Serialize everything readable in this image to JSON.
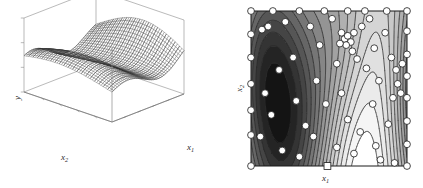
{
  "figure": {
    "title": "",
    "background_color": "#ffffff",
    "panels": [
      {
        "id": "surface",
        "kind": "3d-surface-mesh",
        "axis_labels": {
          "y": "y",
          "x1": "x",
          "x1_sub": "1",
          "x2": "x",
          "x2_sub": "2"
        }
      },
      {
        "id": "contour",
        "kind": "filled-contour",
        "axis_labels": {
          "x1": "x",
          "x1_sub": "1",
          "x2": "x",
          "x2_sub": "2"
        }
      }
    ]
  },
  "chart_data": [
    {
      "type": "surface",
      "id": "left-3d-surface",
      "title": "",
      "xlabel": "x1",
      "ylabel": "x2",
      "zlabel": "y",
      "xlim": [
        0,
        1
      ],
      "ylim": [
        0,
        1
      ],
      "zlim": [
        0,
        1
      ],
      "grid": false,
      "tick_labels_shown": false,
      "mesh": {
        "rows": 42,
        "cols": 42,
        "line_color": "#3a3a3a",
        "face_color": "#ffffff"
      },
      "surface_model": {
        "description": "two parallel ridges running diagonally, with a saddle valley between them and a flat low plain at the front-left corner",
        "formula_hint": "z = 0.46 + 0.30*sin(5.6*u + 0.9) * exp(-2.2*(v-0.52)^2) + 0.22*sin(3.1*v) * (0.3 + u)",
        "ridge_count": 2,
        "ridge_peak_z": [
          0.84,
          0.92
        ],
        "valley_z": 0.22
      },
      "box_color": "#8b8b8b",
      "tick_count_per_axis": 5
    },
    {
      "type": "contour",
      "id": "right-contour",
      "title": "",
      "xlabel": "x1",
      "ylabel": "x2",
      "xlim": [
        0,
        1
      ],
      "ylim": [
        0,
        1
      ],
      "grid": false,
      "tick_labels_shown": false,
      "filled": true,
      "n_levels": 18,
      "colormap": "gray",
      "colormap_stops": [
        "#000000",
        "#141414",
        "#242424",
        "#343434",
        "#454545",
        "#565656",
        "#666666",
        "#767676",
        "#868686",
        "#949494",
        "#a2a2a2",
        "#b0b0b0",
        "#bdbdbd",
        "#c9c9c9",
        "#d5d5d5",
        "#e0e0e0",
        "#ebebeb",
        "#f5f5f5",
        "#ffffff"
      ],
      "contour_line_color": "#2a2a2a",
      "border_color": "#1a1a1a",
      "sample_points": {
        "marker": "circle",
        "face_color": "#ffffff",
        "edge_color": "#1a1a1a",
        "radius_px": 3.4,
        "count": 72,
        "cluster_note": "a dense cluster of points sits near the upper-middle region around (0.60, 0.82)",
        "xy": [
          [
            0.0,
            1.0
          ],
          [
            0.14,
            1.0
          ],
          [
            0.31,
            1.0
          ],
          [
            0.47,
            1.0
          ],
          [
            0.62,
            1.0
          ],
          [
            0.73,
            1.0
          ],
          [
            0.87,
            1.0
          ],
          [
            1.0,
            1.0
          ],
          [
            0.0,
            0.85
          ],
          [
            0.0,
            0.7
          ],
          [
            0.0,
            0.53
          ],
          [
            0.0,
            0.36
          ],
          [
            0.0,
            0.2
          ],
          [
            0.0,
            0.0
          ],
          [
            1.0,
            0.87
          ],
          [
            1.0,
            0.72
          ],
          [
            1.0,
            0.58
          ],
          [
            1.0,
            0.44
          ],
          [
            1.0,
            0.29
          ],
          [
            1.0,
            0.14
          ],
          [
            1.0,
            0.0
          ],
          [
            0.07,
            0.88
          ],
          [
            0.11,
            0.9
          ],
          [
            0.22,
            0.93
          ],
          [
            0.27,
            0.7
          ],
          [
            0.18,
            0.62
          ],
          [
            0.09,
            0.47
          ],
          [
            0.13,
            0.33
          ],
          [
            0.06,
            0.19
          ],
          [
            0.2,
            0.1
          ],
          [
            0.31,
            0.06
          ],
          [
            0.35,
            0.26
          ],
          [
            0.29,
            0.42
          ],
          [
            0.42,
            0.55
          ],
          [
            0.44,
            0.78
          ],
          [
            0.38,
            0.9
          ],
          [
            0.52,
            0.95
          ],
          [
            0.48,
            0.4
          ],
          [
            0.4,
            0.19
          ],
          [
            0.55,
            0.12
          ],
          [
            0.62,
            0.3
          ],
          [
            0.58,
            0.47
          ],
          [
            0.55,
            0.66
          ],
          [
            0.6,
            0.82
          ],
          [
            0.62,
            0.84
          ],
          [
            0.64,
            0.8
          ],
          [
            0.66,
            0.86
          ],
          [
            0.58,
            0.86
          ],
          [
            0.61,
            0.78
          ],
          [
            0.57,
            0.79
          ],
          [
            0.65,
            0.74
          ],
          [
            0.68,
            0.69
          ],
          [
            0.71,
            0.9
          ],
          [
            0.76,
            0.95
          ],
          [
            0.74,
            0.63
          ],
          [
            0.79,
            0.76
          ],
          [
            0.82,
            0.55
          ],
          [
            0.78,
            0.4
          ],
          [
            0.7,
            0.22
          ],
          [
            0.66,
            0.08
          ],
          [
            0.8,
            0.13
          ],
          [
            0.88,
            0.27
          ],
          [
            0.91,
            0.44
          ],
          [
            0.94,
            0.53
          ],
          [
            0.96,
            0.47
          ],
          [
            0.93,
            0.62
          ],
          [
            0.97,
            0.66
          ],
          [
            0.9,
            0.7
          ],
          [
            0.86,
            0.86
          ],
          [
            0.83,
            0.04
          ],
          [
            0.92,
            0.02
          ],
          [
            0.49,
            0.0
          ]
        ]
      },
      "special_marker": {
        "shape": "square",
        "x": 0.49,
        "y": 0.0,
        "face_color": "#ffffff",
        "edge_color": "#1a1a1a"
      },
      "field_model": {
        "description": "vertically elongated alternating light/dark bands; dark minima near x1=0.30 and x1=0.74, bright maximum near x1=0.55",
        "formula_hint": "f = sin(6.0*x1 + 0.4) * (0.55 + 0.45*cos(2.1*x2 - 0.6)) + 0.30*sin(2.6*x2)"
      }
    }
  ]
}
